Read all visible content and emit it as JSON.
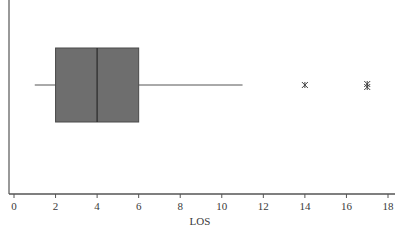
{
  "chart_data": {
    "type": "box",
    "title": "",
    "xlabel": "LOS",
    "ylabel": "",
    "orientation": "horizontal",
    "xlim": [
      0,
      18
    ],
    "xticks": [
      0,
      2,
      4,
      6,
      8,
      10,
      12,
      14,
      16,
      18
    ],
    "grid": false,
    "legend": null,
    "series": [
      {
        "name": "LOS",
        "whisker_low": 1,
        "q1": 2,
        "median": 4,
        "q3": 6,
        "whisker_high": 11,
        "outliers": [
          14,
          17,
          17
        ]
      }
    ],
    "colors": {
      "box_fill": "#6e6e6e",
      "box_stroke": "#4a4a4a",
      "median": "#2a2a2a",
      "whisker": "#555555",
      "outlier": "#444444",
      "axis": "#555555"
    }
  },
  "axis": {
    "xlabel": "LOS",
    "tick_labels": [
      "0",
      "2",
      "4",
      "6",
      "8",
      "10",
      "12",
      "14",
      "16",
      "18"
    ]
  }
}
